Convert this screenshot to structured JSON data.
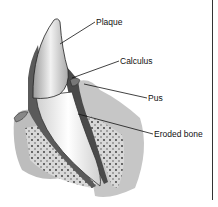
{
  "diagram": {
    "labels": [
      {
        "id": "plaque",
        "text": "Plaque"
      },
      {
        "id": "calculus",
        "text": "Calculus"
      },
      {
        "id": "pus",
        "text": "Pus"
      },
      {
        "id": "eroded_bone",
        "text": "Eroded bone"
      }
    ]
  }
}
